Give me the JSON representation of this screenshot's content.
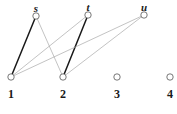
{
  "figure": {
    "type": "bipartite-graph",
    "width": 177,
    "height": 114,
    "background": "#ffffff"
  },
  "colors": {
    "node_stroke": "#555555",
    "node_fill": "#ffffff",
    "edge_highlight": "#1a1a1a",
    "edge_normal": "#a9a9a9",
    "label": "#1a1a1a"
  },
  "nodes": {
    "top": [
      {
        "id": "s",
        "label": "s",
        "x": 36,
        "y": 16,
        "r": 3.2,
        "label_x": 36,
        "label_y": 3
      },
      {
        "id": "t",
        "label": "t",
        "x": 88,
        "y": 15,
        "r": 3.2,
        "label_x": 88,
        "label_y": 2
      },
      {
        "id": "u",
        "label": "u",
        "x": 144,
        "y": 15,
        "r": 3.2,
        "label_x": 144,
        "label_y": 2
      }
    ],
    "bottom": [
      {
        "id": "1",
        "label": "1",
        "x": 11,
        "y": 77,
        "r": 3.2,
        "label_x": 11,
        "label_y": 88
      },
      {
        "id": "2",
        "label": "2",
        "x": 63,
        "y": 77,
        "r": 3.2,
        "label_x": 63,
        "label_y": 88
      },
      {
        "id": "3",
        "label": "3",
        "x": 117,
        "y": 77,
        "r": 3.2,
        "label_x": 117,
        "label_y": 88
      },
      {
        "id": "4",
        "label": "4",
        "x": 170,
        "y": 77,
        "r": 3.2,
        "label_x": 170,
        "label_y": 88
      }
    ]
  },
  "edges": [
    {
      "id": "edge-1-s",
      "from": "1",
      "to": "s",
      "x1": 11,
      "y1": 77,
      "x2": 36,
      "y2": 16,
      "style": "highlight",
      "width": 1.5
    },
    {
      "id": "edge-2-t",
      "from": "2",
      "to": "t",
      "x1": 63,
      "y1": 77,
      "x2": 88,
      "y2": 15,
      "style": "highlight",
      "width": 1.5
    },
    {
      "id": "edge-2-s",
      "from": "2",
      "to": "s",
      "x1": 63,
      "y1": 77,
      "x2": 36,
      "y2": 16,
      "style": "normal",
      "width": 0.7
    },
    {
      "id": "edge-1-t",
      "from": "1",
      "to": "t",
      "x1": 11,
      "y1": 77,
      "x2": 88,
      "y2": 15,
      "style": "normal",
      "width": 0.7
    },
    {
      "id": "edge-1-u",
      "from": "1",
      "to": "u",
      "x1": 11,
      "y1": 77,
      "x2": 144,
      "y2": 15,
      "style": "normal",
      "width": 0.7
    },
    {
      "id": "edge-2-u",
      "from": "2",
      "to": "u",
      "x1": 63,
      "y1": 77,
      "x2": 144,
      "y2": 15,
      "style": "normal",
      "width": 0.7
    }
  ]
}
